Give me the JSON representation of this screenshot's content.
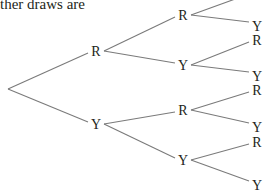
{
  "caption": "ther draws are",
  "tree": {
    "root": {
      "x": 8,
      "y": 89
    },
    "level1": [
      {
        "label": "R",
        "x": 96,
        "y": 51
      },
      {
        "label": "Y",
        "x": 96,
        "y": 124
      }
    ],
    "level2": [
      {
        "label": "R",
        "x": 183,
        "y": 15
      },
      {
        "label": "Y",
        "x": 183,
        "y": 65
      },
      {
        "label": "R",
        "x": 183,
        "y": 110
      },
      {
        "label": "Y",
        "x": 183,
        "y": 160
      }
    ],
    "level3": [
      {
        "label": "R",
        "x": 257,
        "y": -8
      },
      {
        "label": "Y",
        "x": 257,
        "y": 26
      },
      {
        "label": "R",
        "x": 257,
        "y": 40
      },
      {
        "label": "Y",
        "x": 257,
        "y": 76
      },
      {
        "label": "R",
        "x": 257,
        "y": 90
      },
      {
        "label": "Y",
        "x": 257,
        "y": 127
      },
      {
        "label": "R",
        "x": 257,
        "y": 142
      },
      {
        "label": "Y",
        "x": 257,
        "y": 185
      }
    ]
  },
  "colors": {
    "line": "#7a7a7a",
    "text": "#231f20"
  }
}
